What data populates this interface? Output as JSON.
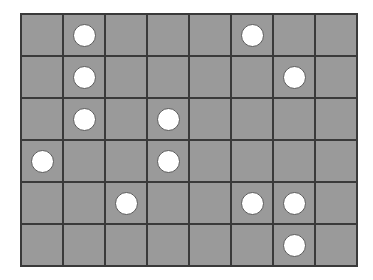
{
  "board": {
    "name": "circle-grid-puzzle",
    "columns": 8,
    "rows": 6,
    "cell_width": 42,
    "cell_height": 42,
    "origin_x": 20,
    "origin_y": 13,
    "circle_diameter": 23,
    "colors": {
      "background": "#ffffff",
      "cell_fill": "#9a9a9a",
      "grid_line": "#3a3a3a",
      "circle_fill": "#ffffff",
      "circle_stroke": "#5a5a5a"
    },
    "circle_count": 12,
    "circle_positions": [
      {
        "row": 1,
        "col": 2
      },
      {
        "row": 1,
        "col": 6
      },
      {
        "row": 2,
        "col": 2
      },
      {
        "row": 2,
        "col": 7
      },
      {
        "row": 3,
        "col": 2
      },
      {
        "row": 3,
        "col": 4
      },
      {
        "row": 4,
        "col": 1
      },
      {
        "row": 4,
        "col": 4
      },
      {
        "row": 5,
        "col": 3
      },
      {
        "row": 5,
        "col": 6
      },
      {
        "row": 5,
        "col": 7
      },
      {
        "row": 6,
        "col": 7
      }
    ],
    "occupancy_matrix": [
      [
        0,
        1,
        0,
        0,
        0,
        1,
        0,
        0
      ],
      [
        0,
        1,
        0,
        0,
        0,
        0,
        1,
        0
      ],
      [
        0,
        1,
        0,
        1,
        0,
        0,
        0,
        0
      ],
      [
        1,
        0,
        0,
        1,
        0,
        0,
        0,
        0
      ],
      [
        0,
        0,
        1,
        0,
        0,
        1,
        1,
        0
      ],
      [
        0,
        0,
        0,
        0,
        0,
        0,
        1,
        0
      ]
    ]
  }
}
